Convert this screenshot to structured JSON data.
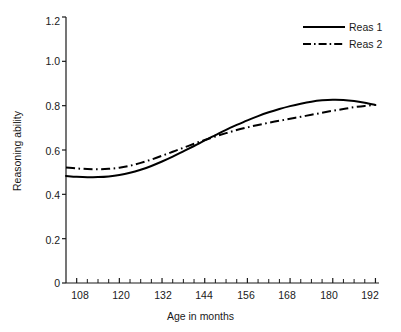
{
  "chart_data": {
    "type": "line",
    "title": "",
    "xlabel": "Age in months",
    "ylabel": "Reasoning ability",
    "xlim": [
      105,
      193
    ],
    "ylim": [
      0,
      1.2
    ],
    "grid": false,
    "legend_position": "top-right",
    "x_ticks_major": [
      108,
      120,
      132,
      144,
      156,
      168,
      180,
      192
    ],
    "x_tick_labels": [
      "108",
      "120",
      "132",
      "144",
      "156",
      "168",
      "180",
      "192"
    ],
    "x_ticks_minor": [
      111,
      114,
      117,
      123,
      126,
      129,
      135,
      138,
      141,
      147,
      150,
      153,
      159,
      162,
      165,
      171,
      174,
      177,
      183,
      186,
      189
    ],
    "y_ticks": [
      0,
      0.2,
      0.4,
      0.6,
      0.8,
      1.0,
      1.2
    ],
    "y_tick_labels": [
      "0",
      "0.2",
      "0.4",
      "0.6",
      "0.8",
      "1.0",
      "1.2"
    ],
    "series": [
      {
        "name": "Reas 1",
        "style": "solid",
        "color": "#000000",
        "x": [
          105,
          108,
          111,
          114,
          117,
          120,
          123,
          126,
          129,
          132,
          135,
          138,
          141,
          144,
          147,
          150,
          153,
          156,
          159,
          162,
          165,
          168,
          171,
          174,
          177,
          180,
          183,
          186,
          189,
          192
        ],
        "y": [
          0.483,
          0.479,
          0.477,
          0.478,
          0.481,
          0.487,
          0.497,
          0.511,
          0.528,
          0.548,
          0.57,
          0.594,
          0.618,
          0.643,
          0.667,
          0.691,
          0.713,
          0.734,
          0.753,
          0.77,
          0.785,
          0.798,
          0.809,
          0.818,
          0.824,
          0.827,
          0.826,
          0.821,
          0.813,
          0.803
        ]
      },
      {
        "name": "Reas 2",
        "style": "dash-dot",
        "color": "#000000",
        "x": [
          105,
          108,
          111,
          114,
          117,
          120,
          123,
          126,
          129,
          132,
          135,
          138,
          141,
          144,
          147,
          150,
          153,
          156,
          159,
          162,
          165,
          168,
          171,
          174,
          177,
          180,
          183,
          186,
          189,
          192
        ],
        "y": [
          0.521,
          0.517,
          0.514,
          0.513,
          0.515,
          0.52,
          0.529,
          0.542,
          0.557,
          0.574,
          0.592,
          0.61,
          0.628,
          0.645,
          0.661,
          0.676,
          0.69,
          0.702,
          0.713,
          0.723,
          0.732,
          0.741,
          0.75,
          0.759,
          0.768,
          0.777,
          0.785,
          0.793,
          0.799,
          0.803
        ]
      }
    ]
  },
  "axes": {
    "y_title": "Reasoning ability",
    "x_title": "Age in months",
    "y_tick_labels": [
      "1.2",
      "1.0",
      "0.8",
      "0.6",
      "0.4",
      "0.2",
      "0"
    ],
    "x_tick_labels": [
      "108",
      "120",
      "132",
      "144",
      "156",
      "168",
      "180",
      "192"
    ]
  },
  "legend": {
    "entries": [
      {
        "label": "Reas 1",
        "style": "solid"
      },
      {
        "label": "Reas 2",
        "style": "dash-dot"
      }
    ]
  }
}
